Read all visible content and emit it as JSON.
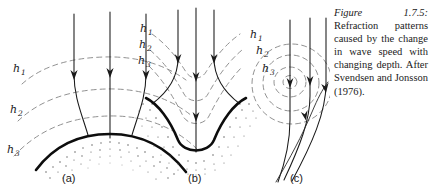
{
  "figure": {
    "caption_number": "Figure 1.7.5:",
    "caption_text": " Refraction patterns caused by the change in wave speed with changing depth. After Svendsen and Jonsson (1976).",
    "caption_full": "Figure 1.7.5: Refraction patterns caused by the change in wave speed with changing depth. After Svendsen and Jonsson (1976)."
  },
  "panels": [
    {
      "id": "a",
      "label": "(a)",
      "feature": "shoal-headland",
      "depth_labels": [
        "h",
        "h",
        "h"
      ],
      "depth_subscripts": [
        "1",
        "2",
        "3"
      ]
    },
    {
      "id": "b",
      "label": "(b)",
      "feature": "submarine-canyon",
      "depth_labels": [
        "h",
        "h",
        "h"
      ],
      "depth_subscripts": [
        "1",
        "2",
        "3"
      ]
    },
    {
      "id": "c",
      "label": "(c)",
      "feature": "isolated-shoal",
      "depth_labels": [
        "h",
        "h",
        "h"
      ],
      "depth_subscripts": [
        "1",
        "2",
        "3"
      ]
    }
  ],
  "labels": {
    "h": "h",
    "sub1": "1",
    "sub2": "2",
    "sub3": "3",
    "panel_a": "(a)",
    "panel_b": "(b)",
    "panel_c": "(c)"
  },
  "colors": {
    "ink": "#1a1a1a",
    "contour": "#7d7d7d",
    "bed": "#0d0d0d",
    "stipple": "#5c5c5c",
    "background": "#ffffff"
  }
}
